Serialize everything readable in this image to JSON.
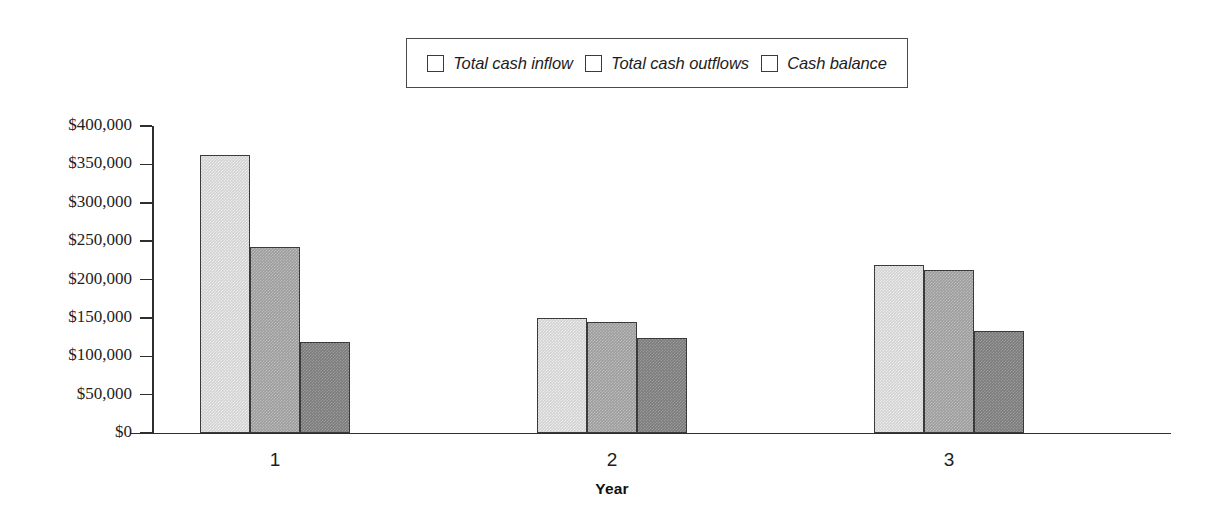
{
  "chart_data": {
    "type": "bar",
    "title": "",
    "xlabel": "Year",
    "ylabel": "",
    "categories": [
      "1",
      "2",
      "3"
    ],
    "series": [
      {
        "name": "Total cash inflow",
        "values": [
          362000,
          150000,
          219000
        ],
        "color": "#d2d2d2"
      },
      {
        "name": "Total cash outflows",
        "values": [
          242000,
          145000,
          212000
        ],
        "color": "#9c9c9c"
      },
      {
        "name": "Cash balance",
        "values": [
          119000,
          124000,
          133000
        ],
        "color": "#7b7b7b"
      }
    ],
    "ylim": [
      0,
      400000
    ],
    "ytick_values": [
      0,
      50000,
      100000,
      150000,
      200000,
      250000,
      300000,
      350000,
      400000
    ],
    "ytick_labels": [
      "$0",
      "$50,000",
      "$100,000",
      "$150,000",
      "$200,000",
      "$250,000",
      "$300,000",
      "$350,000",
      "$400,000"
    ],
    "grid": false,
    "legend_position": "top-center"
  },
  "legend": {
    "entries": [
      {
        "label": "Total cash inflow"
      },
      {
        "label": "Total cash outflows"
      },
      {
        "label": "Cash balance"
      }
    ]
  },
  "axes": {
    "x_title": "Year",
    "x_categories": [
      "1",
      "2",
      "3"
    ],
    "y_labels": [
      "$400,000",
      "$350,000",
      "$300,000",
      "$250,000",
      "$200,000",
      "$150,000",
      "$100,000",
      "$50,000",
      "$0"
    ]
  }
}
